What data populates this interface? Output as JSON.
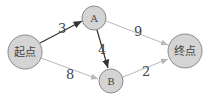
{
  "diagram": {
    "nodes": [
      {
        "id": "start",
        "label": "起点",
        "cx": 25,
        "cy": 52,
        "r": 17
      },
      {
        "id": "A",
        "label": "A",
        "cx": 94,
        "cy": 18,
        "r": 12
      },
      {
        "id": "B",
        "label": "B",
        "cx": 111,
        "cy": 81,
        "r": 12
      },
      {
        "id": "end",
        "label": "终点",
        "cx": 185,
        "cy": 51,
        "r": 17
      }
    ],
    "edges": [
      {
        "from": "start",
        "to": "A",
        "weight": "3",
        "highlight": true
      },
      {
        "from": "start",
        "to": "B",
        "weight": "8",
        "highlight": false
      },
      {
        "from": "A",
        "to": "B",
        "weight": "4",
        "highlight": true
      },
      {
        "from": "A",
        "to": "end",
        "weight": "9",
        "highlight": false
      },
      {
        "from": "B",
        "to": "end",
        "weight": "2",
        "highlight": false
      }
    ],
    "colors": {
      "node_fill": "#d4d4d4",
      "node_stroke": "#8a8a8a",
      "edge_dark": "#333333",
      "edge_light": "#b8b8b8",
      "text": "#444444"
    }
  }
}
